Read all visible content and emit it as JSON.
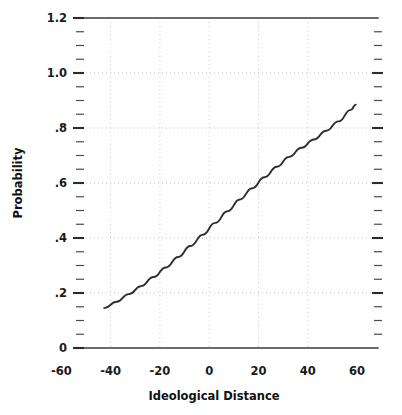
{
  "chart_data": {
    "type": "line",
    "title": "",
    "subtitle": "",
    "xlabel": "Ideological Distance",
    "ylabel": "Probability",
    "xlim": [
      -60,
      60
    ],
    "ylim": [
      0,
      1.2
    ],
    "grid": true,
    "legend": null,
    "legend_position": "none",
    "x_ticks": [
      -60,
      -40,
      -20,
      0,
      20,
      40,
      60
    ],
    "x_tick_labels": [
      "-60",
      "-40",
      "-20",
      "0",
      "20",
      "40",
      "60"
    ],
    "y_ticks": [
      0,
      0.2,
      0.4,
      0.6,
      0.8,
      1.0,
      1.2
    ],
    "y_tick_labels": [
      "0",
      ".2",
      ".4",
      ".6",
      ".8",
      "1.0",
      "1.2"
    ],
    "y_minor_tick_step": 0.05,
    "series": [
      {
        "name": "Predicted probability",
        "color": "#2e2e2e",
        "x": [
          -51,
          -46,
          -41,
          -36,
          -31,
          -26,
          -21,
          -16,
          -11,
          -6,
          -1,
          4,
          9,
          14,
          19,
          24,
          29,
          34,
          39,
          44,
          49,
          51
        ],
        "y": [
          0.145,
          0.168,
          0.196,
          0.225,
          0.258,
          0.293,
          0.331,
          0.371,
          0.412,
          0.455,
          0.497,
          0.54,
          0.581,
          0.621,
          0.659,
          0.695,
          0.728,
          0.758,
          0.79,
          0.824,
          0.866,
          0.885
        ]
      }
    ],
    "annotations": []
  },
  "axes": {
    "x_axis_title": "Ideological Distance",
    "y_axis_title": "Probability"
  }
}
